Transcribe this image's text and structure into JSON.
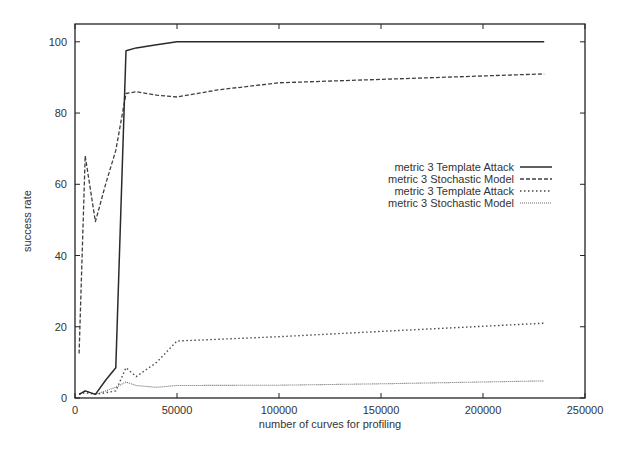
{
  "chart_data": {
    "type": "line",
    "title": "",
    "xlabel": "number of curves for profiling",
    "ylabel": "success rate",
    "xlim": [
      0,
      250000
    ],
    "ylim": [
      0,
      105
    ],
    "xticks": [
      0,
      50000,
      100000,
      150000,
      200000,
      250000
    ],
    "xtick_labels": [
      "0",
      "50000",
      "100000",
      "150000",
      "200000",
      "250000"
    ],
    "yticks": [
      0,
      20,
      40,
      60,
      80,
      100
    ],
    "ytick_labels": [
      "0",
      "20",
      "40",
      "60",
      "80",
      "100"
    ],
    "grid": false,
    "legend_position": "right-center",
    "series": [
      {
        "name": "metric 3 Template Attack",
        "style": "solid",
        "x": [
          2000,
          5000,
          10000,
          15000,
          20000,
          25000,
          30000,
          40000,
          50000,
          100000,
          230000
        ],
        "y": [
          1,
          2,
          1,
          5,
          8.5,
          97.5,
          98.3,
          99.2,
          100,
          100,
          100
        ]
      },
      {
        "name": "metric 3 Stochastic Model",
        "style": "dashed",
        "x": [
          2000,
          5000,
          10000,
          15000,
          20000,
          25000,
          30000,
          40000,
          50000,
          70000,
          100000,
          230000
        ],
        "y": [
          12.5,
          68,
          49.5,
          60,
          69.5,
          85.5,
          86,
          85,
          84.5,
          86.5,
          88.5,
          91
        ]
      },
      {
        "name": "metric 3 Template Attack",
        "style": "dotted",
        "x": [
          2000,
          5000,
          10000,
          15000,
          20000,
          25000,
          30000,
          40000,
          50000,
          100000,
          150000,
          230000
        ],
        "y": [
          1,
          1.5,
          1,
          1.5,
          2,
          8.5,
          6,
          10,
          16,
          17.2,
          18.7,
          21
        ]
      },
      {
        "name": "metric 3 Stochastic Model",
        "style": "dash-dot",
        "x": [
          2000,
          5000,
          10000,
          15000,
          20000,
          25000,
          30000,
          40000,
          50000,
          100000,
          150000,
          230000
        ],
        "y": [
          1,
          2,
          1,
          2,
          3,
          4.5,
          3.5,
          3,
          3.5,
          3.6,
          4,
          4.8
        ]
      }
    ]
  },
  "legend": {
    "items": [
      {
        "label": "metric 3 Template Attack"
      },
      {
        "label": "metric 3 Stochastic Model"
      },
      {
        "label": "metric 3 Template Attack"
      },
      {
        "label": "metric 3 Stochastic Model"
      }
    ]
  },
  "colors": {
    "line": "#2a2a2a",
    "axis": "#222222",
    "text": "#333333",
    "background": "#ffffff"
  }
}
